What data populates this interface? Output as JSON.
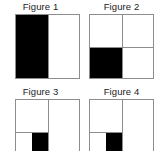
{
  "panel": {
    "title": "Four fraction figures",
    "background_color": "#ffffff",
    "outline_color": "#8d8d8d",
    "fill_color": "#000000",
    "empty_color": "#ffffff"
  },
  "figures": [
    {
      "id": "figure-1",
      "caption": "Figure 1",
      "description": "Square divided into two equal vertical halves; left half shaded",
      "total_parts": 2,
      "shaded_parts": 1,
      "fraction": "1/2",
      "divisions": "vertical-halves",
      "shaded_regions": [
        "left-half"
      ]
    },
    {
      "id": "figure-2",
      "caption": "Figure 2",
      "description": "Square divided into four equal quadrants; bottom-left quadrant shaded",
      "total_parts": 4,
      "shaded_parts": 1,
      "fraction": "1/4",
      "divisions": "quadrants",
      "shaded_regions": [
        "bottom-left-quadrant"
      ]
    },
    {
      "id": "figure-3",
      "caption": "Figure 3",
      "description": "Square divided into quadrants with the bottom-left quadrant split in half; its right portion shaded",
      "total_parts": 8,
      "shaded_parts": 1,
      "fraction": "1/8",
      "divisions": "quadrants-with-split-bottom-left",
      "shaded_regions": [
        "bottom-left-quadrant-right-half"
      ]
    },
    {
      "id": "figure-4",
      "caption": "Figure 4",
      "description": "Square divided into quadrants with the bottom-left quadrant split in half; its right portion shaded",
      "total_parts": 8,
      "shaded_parts": 1,
      "fraction": "1/8",
      "divisions": "quadrants-with-split-bottom-left",
      "shaded_regions": [
        "bottom-left-quadrant-right-half"
      ]
    }
  ]
}
